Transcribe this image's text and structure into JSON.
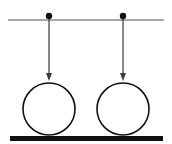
{
  "diagram": {
    "colors": {
      "background": "#ffffff",
      "support_line": "#8a8a8a",
      "arrow": "#3a3a3a",
      "pivot": "#111111",
      "circle": "#111111",
      "ground": "#111111"
    },
    "support_line": {
      "x1": 8,
      "x2": 164,
      "y": 20
    },
    "ground": {
      "x": 10,
      "y": 136,
      "width": 153,
      "height": 5
    },
    "pendulums": [
      {
        "id": "left",
        "pivot": {
          "cx": 49,
          "cy": 16,
          "r": 3.2
        },
        "arrow_tip_y": 81,
        "circle": {
          "cx": 49,
          "cy": 109,
          "r": 26
        }
      },
      {
        "id": "right",
        "pivot": {
          "cx": 123,
          "cy": 16,
          "r": 3.2
        },
        "arrow_tip_y": 81,
        "circle": {
          "cx": 123,
          "cy": 109,
          "r": 26
        }
      }
    ]
  }
}
